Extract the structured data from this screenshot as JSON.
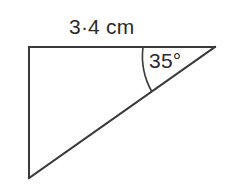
{
  "figure": {
    "name": "right-triangle-diagram",
    "background_color": "#ffffff",
    "stroke_color": "#3a3a3a",
    "text_color": "#2b2b2b",
    "stroke_width": 2,
    "labels": {
      "side_length": "3·4 cm",
      "angle": "35°"
    },
    "vertices": {
      "top_left": {
        "x": 29,
        "y": 47
      },
      "top_right_apex": {
        "x": 215,
        "y": 47
      },
      "bottom_left": {
        "x": 29,
        "y": 178
      }
    },
    "edges": [
      {
        "name": "top-side",
        "from": "top_left",
        "to": "top_right_apex"
      },
      {
        "name": "left-side",
        "from": "top_left",
        "to": "bottom_left"
      },
      {
        "name": "hypotenuse",
        "from": "bottom_left",
        "to": "top_right_apex"
      }
    ],
    "angle_arc": {
      "name": "angle-arc-35",
      "at_vertex": "top_right_apex",
      "value_degrees": 35,
      "start": {
        "x": 143,
        "y": 47
      },
      "end": {
        "x": 152,
        "y": 92
      },
      "radius": 73
    }
  }
}
